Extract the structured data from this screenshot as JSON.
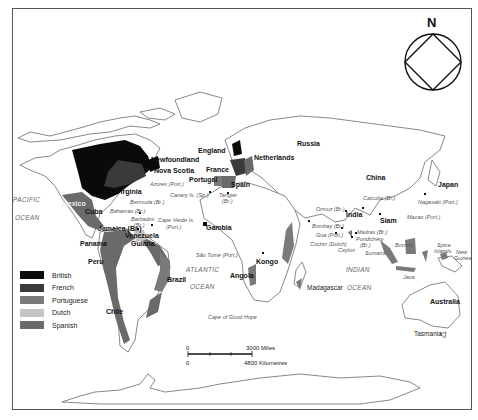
{
  "compass": {
    "label": "N"
  },
  "legend": {
    "items": [
      {
        "label": "British",
        "color": "#0a0a0a"
      },
      {
        "label": "French",
        "color": "#3a3a3a"
      },
      {
        "label": "Portuguese",
        "color": "#7a7a7a"
      },
      {
        "label": "Dutch",
        "color": "#c4c4c4"
      },
      {
        "label": "Spanish",
        "color": "#6a6a6a"
      }
    ]
  },
  "oceans": {
    "pacific_1": "PACIFIC",
    "pacific_2": "OCEAN",
    "atlantic_1": "ATLANTIC",
    "atlantic_2": "OCEAN",
    "indian_1": "INDIAN",
    "indian_2": "OCEAN"
  },
  "regions": {
    "russia": "Russia",
    "china": "China",
    "japan": "Japan",
    "india": "India",
    "siam": "Siam",
    "australia": "Australia",
    "tasmania": "Tasmania",
    "newfoundland": "Newfoundland",
    "nova_scotia": "Nova Scotia",
    "virginia": "Virginia",
    "mexico": "Mexico",
    "cuba": "Cuba",
    "jamaica": "Jamaica (Br.)",
    "panama": "Panama",
    "venezuela": "Venezuela",
    "guiana": "Guiana",
    "peru": "Peru",
    "brazil": "Brazil",
    "chile": "Chile",
    "england": "England",
    "france": "France",
    "netherlands": "Netherlands",
    "portugal": "Portugal",
    "spain": "Spain",
    "gambia": "Gambia",
    "kongo": "Kongo",
    "angola": "Angola",
    "madagascar": "Madagascar"
  },
  "outposts": {
    "azores": "Azores (Port.)",
    "bermuda": "Bermuda (Br.)",
    "bahamas": "Bahamas (Br.)",
    "barbados_1": "Barbados",
    "barbados_2": "(Br.)",
    "canary": "Canary Is. (Sp.)",
    "tangier_1": "Tangier",
    "tangier_2": "(Br.)",
    "cape_verde_1": "Cape Verde Is.",
    "cape_verde_2": "(Port.)",
    "sao_tome": "São Tomé (Port.)",
    "cape_good_hope": "Cape of Good Hope",
    "ormuz": "Ormuz (Br.)",
    "bombay": "Bombay (Br.)",
    "goa": "Goa (Port.)",
    "cochin": "Cochin (Dutch)",
    "ceylon": "Ceylon",
    "madras": "Madras (Br.)",
    "pondichery_1": "Pondichéry",
    "pondichery_2": "(Br.)",
    "calcutta": "Calcutta (Br.)",
    "macao": "Macao (Port.)",
    "nagasaki": "Nagasaki (Port.)",
    "sumatra": "Sumatra",
    "borneo": "Borneo",
    "java": "Java",
    "spice_1": "Spice",
    "spice_2": "Islands",
    "new_guinea_1": "New",
    "new_guinea_2": "Guinea"
  },
  "scale": {
    "miles_zero": "0",
    "miles_label": "3000 Miles",
    "km_zero": "0",
    "km_label": "4800 Kilometres"
  }
}
